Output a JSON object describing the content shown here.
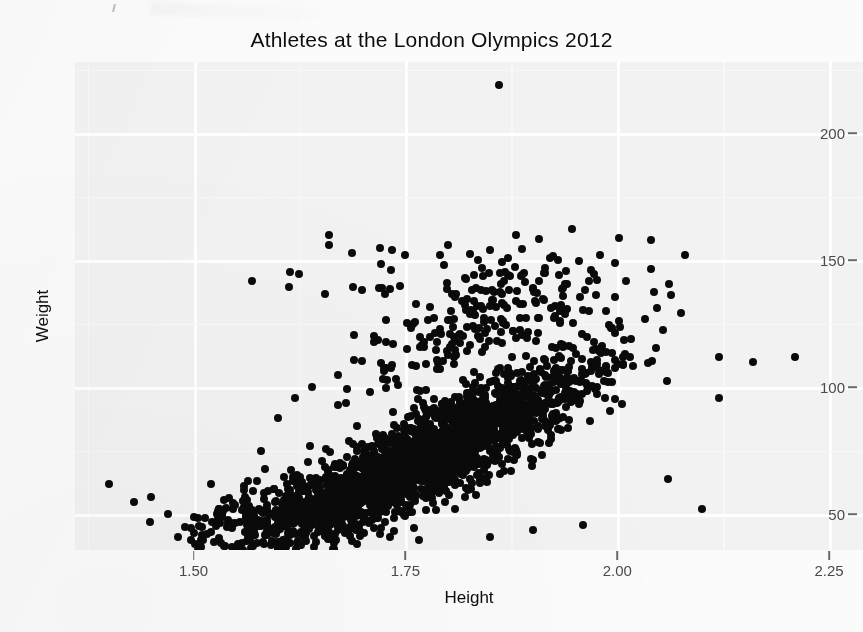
{
  "chart_data": {
    "type": "scatter",
    "title": "Athletes at the London Olympics 2012",
    "xlabel": "Height",
    "ylabel": "Weight",
    "xlim": [
      1.36,
      2.29
    ],
    "ylim": [
      36,
      228
    ],
    "xticks": [
      1.5,
      1.75,
      2.0,
      2.25
    ],
    "xticklabels": [
      "1.50",
      "1.75",
      "2.00",
      "2.25"
    ],
    "yticks": [
      50,
      100,
      150,
      200
    ],
    "yticklabels": [
      "50",
      "100",
      "150",
      "200"
    ],
    "grid": true,
    "grid_color": "#ffffff",
    "panel_color": "#f2f2f2",
    "point_color": "#0a0a0a",
    "point_size": 8,
    "legend": "none",
    "series": [
      {
        "name": "Athletes",
        "x": [
          1.86
        ],
        "y": [
          219
        ],
        "note": "extreme outlier near top of panel"
      }
    ],
    "point_count_approx": 2400
  },
  "chart": {
    "title": "Athletes at the London Olympics 2012",
    "x_axis_title": "Height",
    "y_axis_title": "Weight",
    "x_tick_labels": [
      "1.50",
      "1.75",
      "2.00",
      "2.25"
    ],
    "y_tick_labels": [
      "200",
      "150",
      "100",
      "50"
    ]
  }
}
